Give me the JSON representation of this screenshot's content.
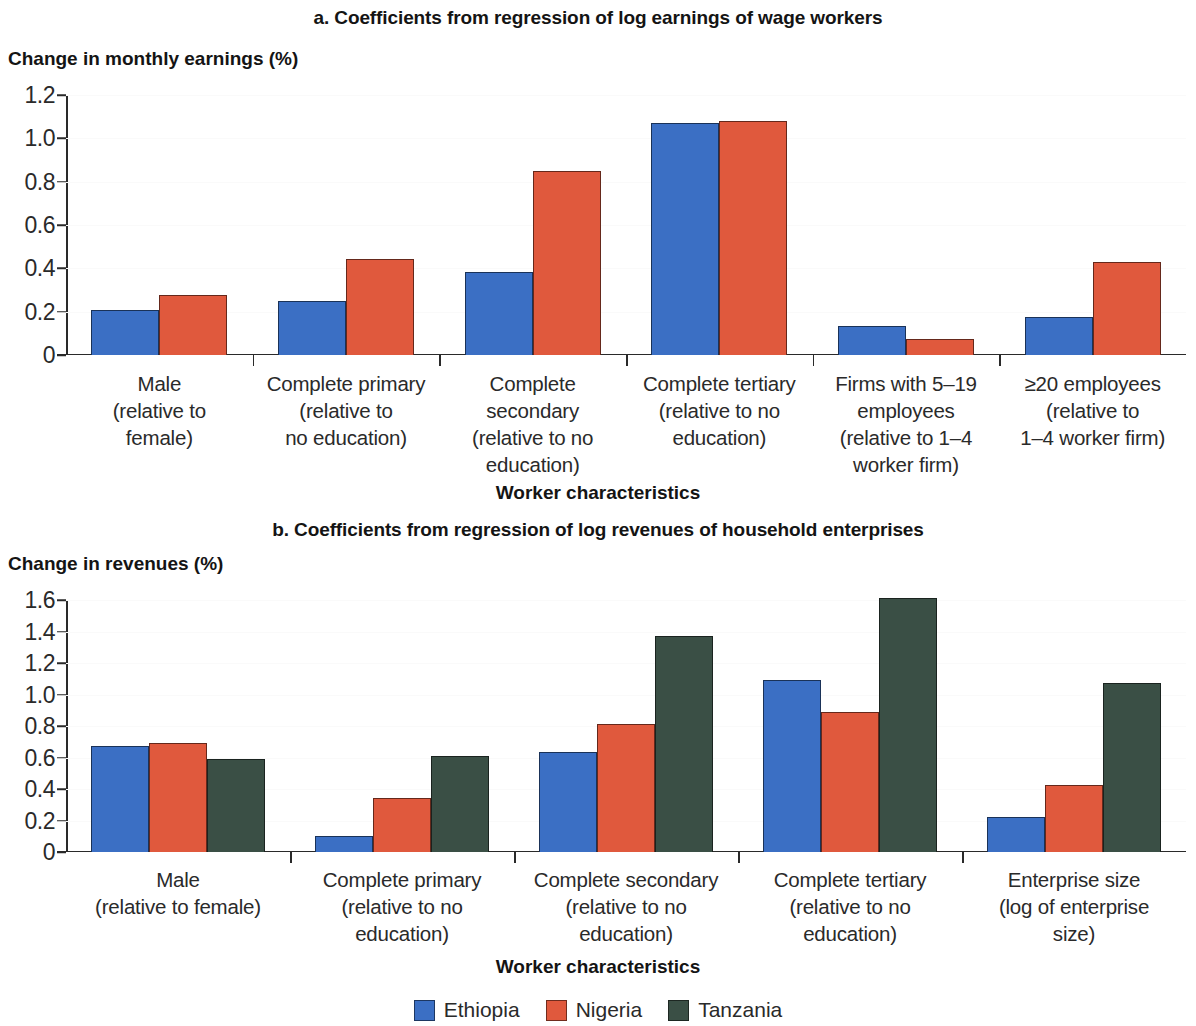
{
  "colors": {
    "ethiopia": "#3b6fc4",
    "nigeria": "#e0593d",
    "tanzania": "#3a4f45",
    "axis": "#2a2a2a",
    "text": "#1a1a1a",
    "grid": "#fafafa"
  },
  "legend": {
    "items": [
      {
        "label": "Ethiopia",
        "color_key": "ethiopia"
      },
      {
        "label": "Nigeria",
        "color_key": "nigeria"
      },
      {
        "label": "Tanzania",
        "color_key": "tanzania"
      }
    ]
  },
  "panel_a": {
    "title": "a. Coefficients from regression of log earnings of wage workers",
    "ylabel": "Change in monthly earnings (%)",
    "xlabel": "Worker characteristics"
  },
  "panel_b": {
    "title": "b. Coefficients from regression of log revenues of household enterprises",
    "ylabel": "Change in revenues (%)",
    "xlabel": "Worker characteristics"
  },
  "chart_data": [
    {
      "type": "bar",
      "id": "panel-a",
      "title": "a. Coefficients from regression of log earnings of wage workers",
      "xlabel": "Worker characteristics",
      "ylabel": "Change in monthly earnings (%)",
      "ylim": [
        0,
        1.2
      ],
      "yticks": [
        0,
        0.2,
        0.4,
        0.6,
        0.8,
        1.0,
        1.2
      ],
      "ytick_labels": [
        "0",
        "0.2",
        "0.4",
        "0.6",
        "0.8",
        "1.0",
        "1.2"
      ],
      "grid": true,
      "legend_position": "bottom",
      "categories": [
        "Male\n(relative to\nfemale)",
        "Complete primary\n(relative to\nno education)",
        "Complete\nsecondary\n(relative to no\neducation)",
        "Complete tertiary\n(relative to no\neducation)",
        "Firms with 5–19\nemployees\n(relative to 1–4\nworker firm)",
        "≥20 employees\n(relative to\n1–4 worker firm)"
      ],
      "series": [
        {
          "name": "Ethiopia",
          "color": "#3b6fc4",
          "values": [
            0.21,
            0.25,
            0.385,
            1.07,
            0.135,
            0.175
          ]
        },
        {
          "name": "Nigeria",
          "color": "#e0593d",
          "values": [
            0.275,
            0.445,
            0.85,
            1.08,
            0.075,
            0.43
          ]
        }
      ]
    },
    {
      "type": "bar",
      "id": "panel-b",
      "title": "b. Coefficients from regression of log revenues of household enterprises",
      "xlabel": "Worker characteristics",
      "ylabel": "Change in revenues (%)",
      "ylim": [
        0,
        1.6
      ],
      "yticks": [
        0,
        0.2,
        0.4,
        0.6,
        0.8,
        1.0,
        1.2,
        1.4,
        1.6
      ],
      "ytick_labels": [
        "0",
        "0.2",
        "0.4",
        "0.6",
        "0.8",
        "1.0",
        "1.2",
        "1.4",
        "1.6"
      ],
      "grid": true,
      "legend_position": "bottom",
      "categories": [
        "Male\n(relative to female)",
        "Complete primary\n(relative to no\neducation)",
        "Complete secondary\n(relative to no\neducation)",
        "Complete tertiary\n(relative to no\neducation)",
        "Enterprise size\n(log of enterprise\nsize)"
      ],
      "series": [
        {
          "name": "Ethiopia",
          "color": "#3b6fc4",
          "values": [
            0.67,
            0.1,
            0.635,
            1.09,
            0.22
          ]
        },
        {
          "name": "Nigeria",
          "color": "#e0593d",
          "values": [
            0.69,
            0.34,
            0.81,
            0.89,
            0.425
          ]
        },
        {
          "name": "Tanzania",
          "color": "#3a4f45",
          "values": [
            0.59,
            0.61,
            1.37,
            1.61,
            1.07
          ]
        }
      ]
    }
  ]
}
